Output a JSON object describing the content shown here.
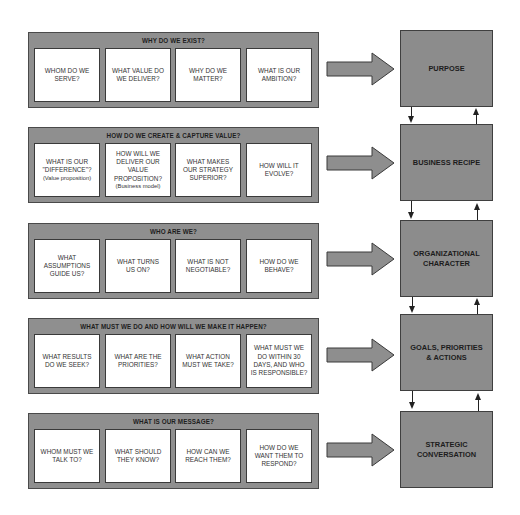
{
  "rows": [
    {
      "title": "WHY DO WE EXIST?",
      "questions": [
        {
          "lines": [
            "WHOM DO WE",
            "SERVE?"
          ]
        },
        {
          "lines": [
            "WHAT VALUE DO",
            "WE DELIVER?"
          ]
        },
        {
          "lines": [
            "WHY DO WE",
            "MATTER?"
          ]
        },
        {
          "lines": [
            "WHAT IS OUR",
            "AMBITION?"
          ]
        }
      ],
      "outcome": {
        "lines": [
          "PURPOSE"
        ]
      }
    },
    {
      "title": "HOW DO WE CREATE & CAPTURE VALUE?",
      "questions": [
        {
          "lines": [
            "WHAT IS OUR",
            "\"DIFFERENCE\"?",
            "(Value proposition)"
          ]
        },
        {
          "lines": [
            "HOW WILL WE",
            "DELIVER OUR",
            "VALUE",
            "PROPOSITION?",
            "(Business model)"
          ]
        },
        {
          "lines": [
            "WHAT MAKES",
            "OUR STRATEGY",
            "SUPERIOR?"
          ]
        },
        {
          "lines": [
            "HOW WILL IT",
            "EVOLVE?"
          ]
        }
      ],
      "outcome": {
        "lines": [
          "BUSINESS RECIPE"
        ]
      }
    },
    {
      "title": "WHO ARE WE?",
      "questions": [
        {
          "lines": [
            "WHAT",
            "ASSUMPTIONS",
            "GUIDE US?"
          ]
        },
        {
          "lines": [
            "WHAT TURNS",
            "US ON?"
          ]
        },
        {
          "lines": [
            "WHAT IS NOT",
            "NEGOTIABLE?"
          ]
        },
        {
          "lines": [
            "HOW DO WE",
            "BEHAVE?"
          ]
        }
      ],
      "outcome": {
        "lines": [
          "ORGANIZATIONAL",
          "CHARACTER"
        ]
      }
    },
    {
      "title": "WHAT MUST WE DO AND HOW WILL WE MAKE IT HAPPEN?",
      "questions": [
        {
          "lines": [
            "WHAT RESULTS",
            "DO WE SEEK?"
          ]
        },
        {
          "lines": [
            "WHAT ARE THE",
            "PRIORITIES?"
          ]
        },
        {
          "lines": [
            "WHAT ACTION",
            "MUST WE TAKE?"
          ]
        },
        {
          "lines": [
            "WHAT MUST WE",
            "DO WITHIN 30",
            "DAYS, AND WHO",
            "IS RESPONSIBLE?"
          ]
        }
      ],
      "outcome": {
        "lines": [
          "GOALS, PRIORITIES",
          "& ACTIONS"
        ]
      }
    },
    {
      "title": "WHAT IS OUR MESSAGE?",
      "questions": [
        {
          "lines": [
            "WHOM MUST WE",
            "TALK TO?"
          ]
        },
        {
          "lines": [
            "WHAT SHOULD",
            "THEY KNOW?"
          ]
        },
        {
          "lines": [
            "HOW CAN WE",
            "REACH THEM?"
          ]
        },
        {
          "lines": [
            "HOW DO WE",
            "WANT THEM TO",
            "RESPOND?"
          ]
        }
      ],
      "outcome": {
        "lines": [
          "STRATEGIC",
          "CONVERSATION"
        ]
      }
    }
  ],
  "colors": {
    "panel": "#8f8f8f",
    "outcome": "#8c8c8c",
    "arrow": "#8e8e8e",
    "card": "#ffffff",
    "text": "#1e1e1e"
  }
}
